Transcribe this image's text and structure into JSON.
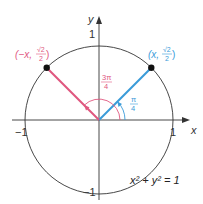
{
  "diagram": {
    "type": "unit-circle",
    "equation": "x² + y² = 1",
    "axes": {
      "x_label": "x",
      "y_label": "y",
      "x_ticks": [
        "−1",
        "1"
      ],
      "y_ticks": [
        "1",
        "−1"
      ]
    },
    "points": [
      {
        "label_prefix": "(x, ",
        "label_num": "√2",
        "label_den": "2",
        "label_suffix": ")",
        "angle": "π/4",
        "angle_num": "π",
        "angle_den": "4",
        "color": "#3a9bd9"
      },
      {
        "label_prefix": "(−x, ",
        "label_num": "√2",
        "label_den": "2",
        "label_suffix": ")",
        "angle": "3π/4",
        "angle_num": "3π",
        "angle_den": "4",
        "color": "#e0577f"
      }
    ],
    "colors": {
      "axis": "#333333",
      "circle": "#333333",
      "blue": "#3a9bd9",
      "pink": "#e0577f",
      "dot": "#111111"
    }
  }
}
